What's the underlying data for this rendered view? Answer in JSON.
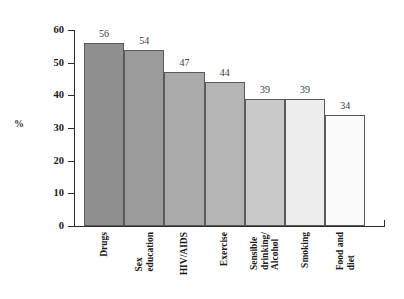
{
  "chart_data": {
    "type": "bar",
    "title": "",
    "subtitle": "",
    "xlabel": "",
    "ylabel": "%",
    "ylim": [
      0,
      60
    ],
    "grid": false,
    "legend": "none",
    "y_ticks": [
      0,
      10,
      20,
      30,
      40,
      50,
      60
    ],
    "categories": [
      "Drugs",
      "Sex\neducation",
      "HIV/AIDS",
      "Exercise",
      "Sensible\ndrinking/\nAlcohol",
      "Smoking",
      "Food and\ndiet"
    ],
    "values": [
      56,
      54,
      47,
      44,
      39,
      39,
      34
    ],
    "value_labels": [
      "56",
      "54",
      "47",
      "44",
      "39",
      "39",
      "34"
    ],
    "bar_colors": [
      "#8f8f8f",
      "#9b9b9b",
      "#aaaaaa",
      "#b4b4b4",
      "#c9c9c9",
      "#ededed",
      "#fbfbfb"
    ],
    "bar_border_color": "#5a5a5a",
    "axis_color": "#2b2b2b"
  }
}
